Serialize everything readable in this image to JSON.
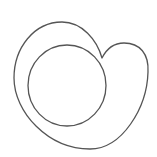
{
  "figure": {
    "description": "Line drawing: asymmetric heart-shaped outline enclosing a circle",
    "stroke_color": "#555555",
    "background_color": "#ffffff",
    "stroke_width": 1.3,
    "outer_shape": {
      "name": "heart-outline",
      "notch_point": [
        102,
        58
      ],
      "left_extent_x": 14,
      "right_extent_x": 148,
      "top_y": 22,
      "bottom_point": [
        90,
        149
      ]
    },
    "inner_circle": {
      "name": "inner-circle",
      "cx": 67,
      "cy": 85.5,
      "rx": 39,
      "ry": 40.5
    }
  }
}
